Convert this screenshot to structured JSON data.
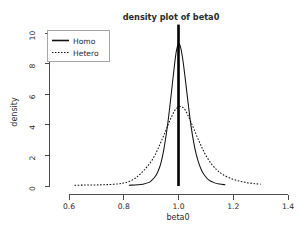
{
  "chart_data": {
    "type": "line",
    "title": "density plot of beta0",
    "xlabel": "beta0",
    "ylabel": "density",
    "xlim": [
      0.55,
      1.42
    ],
    "ylim": [
      0,
      10.6
    ],
    "grid": false,
    "legend_position": "top-left",
    "xticks": [
      "0.6",
      "0.8",
      "1.0",
      "1.2",
      "1.4"
    ],
    "xtick_values": [
      0.6,
      0.8,
      1.0,
      1.2,
      1.4
    ],
    "yticks": [
      "0",
      "2",
      "4",
      "6",
      "8",
      "10"
    ],
    "ytick_values": [
      0,
      2,
      4,
      6,
      8,
      10
    ],
    "annotations": [
      {
        "name": "true-value-reference-line",
        "type": "vline",
        "x": 1.0,
        "label": "1.0"
      }
    ],
    "series": [
      {
        "name": "Homo",
        "style": "solid",
        "peak_x": 1.0,
        "peak_y": 9.3,
        "x": [
          0.82,
          0.85,
          0.87,
          0.89,
          0.9,
          0.915,
          0.925,
          0.935,
          0.945,
          0.955,
          0.962,
          0.97,
          0.978,
          0.985,
          0.992,
          1.0,
          1.008,
          1.015,
          1.022,
          1.03,
          1.038,
          1.046,
          1.055,
          1.065,
          1.075,
          1.085,
          1.095,
          1.11,
          1.13,
          1.15,
          1.17
        ],
        "y": [
          0.05,
          0.08,
          0.12,
          0.22,
          0.34,
          0.62,
          0.95,
          1.45,
          2.25,
          3.35,
          4.25,
          5.45,
          6.75,
          7.85,
          8.8,
          9.3,
          9.05,
          8.35,
          7.4,
          6.2,
          5.0,
          3.9,
          2.9,
          2.05,
          1.45,
          1.0,
          0.7,
          0.4,
          0.22,
          0.13,
          0.08
        ]
      },
      {
        "name": "Hetero",
        "style": "dotted",
        "peak_x": 1.01,
        "peak_y": 5.2,
        "x": [
          0.62,
          0.66,
          0.7,
          0.74,
          0.78,
          0.8,
          0.82,
          0.84,
          0.855,
          0.87,
          0.885,
          0.9,
          0.915,
          0.928,
          0.94,
          0.952,
          0.963,
          0.974,
          0.985,
          0.995,
          1.005,
          1.015,
          1.025,
          1.035,
          1.045,
          1.058,
          1.072,
          1.086,
          1.1,
          1.12,
          1.14,
          1.16,
          1.19,
          1.22,
          1.25,
          1.28,
          1.3
        ],
        "y": [
          0.05,
          0.06,
          0.07,
          0.09,
          0.14,
          0.2,
          0.3,
          0.48,
          0.7,
          0.95,
          1.25,
          1.6,
          2.05,
          2.55,
          3.05,
          3.55,
          4.05,
          4.5,
          4.9,
          5.1,
          5.2,
          5.15,
          4.95,
          4.6,
          4.2,
          3.65,
          3.05,
          2.5,
          2.0,
          1.45,
          1.05,
          0.78,
          0.5,
          0.33,
          0.22,
          0.15,
          0.12
        ]
      }
    ]
  }
}
